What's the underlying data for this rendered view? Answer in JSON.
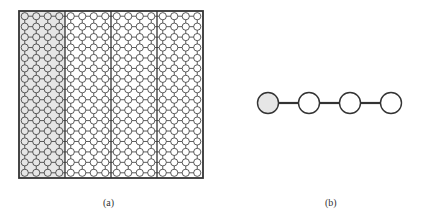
{
  "panel_a": {
    "label": "(a)",
    "grid": {
      "rows": 16,
      "cols": 16,
      "blocks": 4,
      "cols_per_block": 4,
      "highlighted_block": 0
    },
    "colors": {
      "stroke": "#333333",
      "highlight_fill": "#e6e6e6",
      "node_fill": "#ffffff"
    }
  },
  "panel_b": {
    "label": "(b)",
    "nodes": 4,
    "highlighted_node": 0,
    "colors": {
      "stroke": "#333333",
      "highlight_fill": "#e6e6e6",
      "node_fill": "#ffffff"
    }
  }
}
